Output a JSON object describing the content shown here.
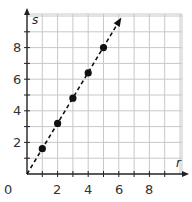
{
  "chart_data": {
    "type": "scatter",
    "title": "",
    "xlabel": "r",
    "ylabel": "s",
    "xlim": [
      0,
      10
    ],
    "ylim": [
      0,
      10
    ],
    "grid": true,
    "x_ticks": [
      2,
      4,
      6,
      8
    ],
    "y_ticks": [
      2,
      4,
      6,
      8
    ],
    "origin_label": "0",
    "series": [
      {
        "name": "points",
        "x": [
          1,
          2,
          3,
          4,
          5
        ],
        "y": [
          1.6,
          3.2,
          4.8,
          6.4,
          8.0
        ]
      }
    ],
    "line": {
      "style": "dashed",
      "from": [
        0,
        0
      ],
      "to": [
        6.1,
        9.8
      ],
      "arrow": true,
      "equation": "s = 1.6r"
    }
  },
  "labels": {
    "x_axis": "r",
    "y_axis": "s",
    "origin": "0",
    "x_ticks": [
      "2",
      "4",
      "6",
      "8"
    ],
    "y_ticks": [
      "2",
      "4",
      "6",
      "8"
    ]
  },
  "colors": {
    "grid": "#c8c8c8",
    "axis": "#222222",
    "points": "#111111"
  }
}
